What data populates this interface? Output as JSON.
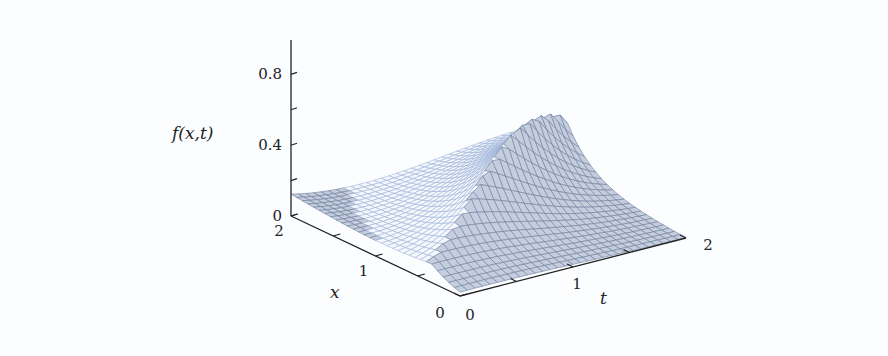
{
  "chart_data": {
    "type": "surface",
    "title": "",
    "zlabel": "f(x,t)",
    "xlabel": "x",
    "ylabel": "t",
    "zlim": [
      0,
      0.9
    ],
    "xlim": [
      0,
      2
    ],
    "tlim": [
      0,
      2
    ],
    "z_ticks": [
      {
        "value": 0,
        "label": "0"
      },
      {
        "value": 0.2,
        "label": ""
      },
      {
        "value": 0.4,
        "label": "0.4"
      },
      {
        "value": 0.6,
        "label": ""
      },
      {
        "value": 0.8,
        "label": "0.8"
      }
    ],
    "x_ticks": [
      {
        "value": 0,
        "label": "0"
      },
      {
        "value": 0.5,
        "label": ""
      },
      {
        "value": 1,
        "label": "1"
      },
      {
        "value": 1.5,
        "label": ""
      },
      {
        "value": 2,
        "label": "2"
      }
    ],
    "t_ticks": [
      {
        "value": 0,
        "label": "0"
      },
      {
        "value": 0.5,
        "label": ""
      },
      {
        "value": 1,
        "label": "1"
      },
      {
        "value": 1.5,
        "label": ""
      },
      {
        "value": 2,
        "label": "2"
      }
    ],
    "grid": false,
    "legend": null,
    "surface_samples": [
      {
        "x": 2,
        "t": 0,
        "f": 0.12
      },
      {
        "x": 1,
        "t": 1.2,
        "f": 0.57
      },
      {
        "x": 2,
        "t": 2,
        "f": 0.05
      },
      {
        "x": 0,
        "t": 2,
        "f": 0.0
      },
      {
        "x": 0,
        "t": 0,
        "f": 0.0
      }
    ],
    "mesh": {
      "nx": 30,
      "nt": 30
    },
    "colors": {
      "axis": "#222222",
      "mesh_front": "#6f7d9c",
      "mesh_back": "#9fb4d8",
      "background": "#fbfdff"
    }
  },
  "labels": {
    "z_axis": "f(x,t)",
    "x_axis": "x",
    "t_axis": "t"
  }
}
